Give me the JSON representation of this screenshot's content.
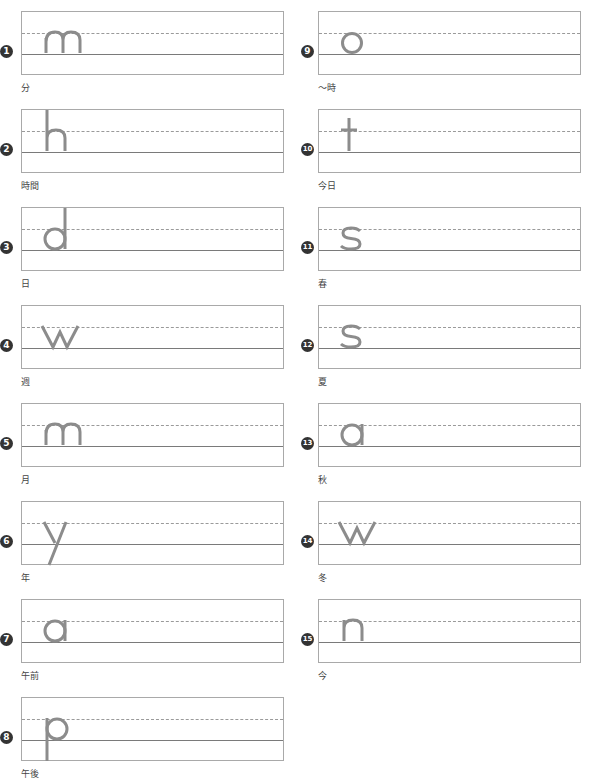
{
  "worksheet": {
    "colors": {
      "letter": "#8c8c8c",
      "box_border": "#a9a9a9",
      "dashed_line": "#9a9a9a",
      "baseline": "#7a7a7a",
      "badge": "#333333"
    },
    "items": [
      {
        "number": "1",
        "letter": "m",
        "label": "分"
      },
      {
        "number": "2",
        "letter": "h",
        "label": "時間"
      },
      {
        "number": "3",
        "letter": "d",
        "label": "日"
      },
      {
        "number": "4",
        "letter": "w",
        "label": "週"
      },
      {
        "number": "5",
        "letter": "m",
        "label": "月"
      },
      {
        "number": "6",
        "letter": "y",
        "label": "年"
      },
      {
        "number": "7",
        "letter": "a",
        "label": "午前"
      },
      {
        "number": "8",
        "letter": "p",
        "label": "午後"
      },
      {
        "number": "9",
        "letter": "o",
        "label": "〜時"
      },
      {
        "number": "10",
        "letter": "t",
        "label": "今日"
      },
      {
        "number": "11",
        "letter": "s",
        "label": "春"
      },
      {
        "number": "12",
        "letter": "s",
        "label": "夏"
      },
      {
        "number": "13",
        "letter": "a",
        "label": "秋"
      },
      {
        "number": "14",
        "letter": "w",
        "label": "冬"
      },
      {
        "number": "15",
        "letter": "n",
        "label": "今"
      }
    ]
  }
}
